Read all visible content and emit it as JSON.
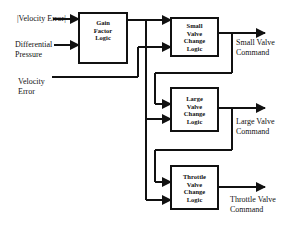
{
  "diagram": {
    "type": "block-diagram",
    "inputs": {
      "abs_velocity_error": "|Velocity Error|",
      "differential_pressure_line1": "Differential",
      "differential_pressure_line2": "Pressure",
      "velocity_error_line1": "Velocity",
      "velocity_error_line2": "Error"
    },
    "blocks": {
      "gain": {
        "line1": "Gain",
        "line2": "Factor",
        "line3": "Logic"
      },
      "small": {
        "line1": "Small",
        "line2": "Valve",
        "line3": "Change",
        "line4": "Logic"
      },
      "large": {
        "line1": "Large",
        "line2": "Valve",
        "line3": "Change",
        "line4": "Logic"
      },
      "throttle": {
        "line1": "Throttle",
        "line2": "Valve",
        "line3": "Change",
        "line4": "Logic"
      }
    },
    "outputs": {
      "small_line1": "Small Valve",
      "small_line2": "Command",
      "large_line1": "Large Valve",
      "large_line2": "Command",
      "throttle_line1": "Throttle Valve",
      "throttle_line2": "Command"
    },
    "colors": {
      "stroke": "#111111",
      "background": "#ffffff"
    }
  }
}
